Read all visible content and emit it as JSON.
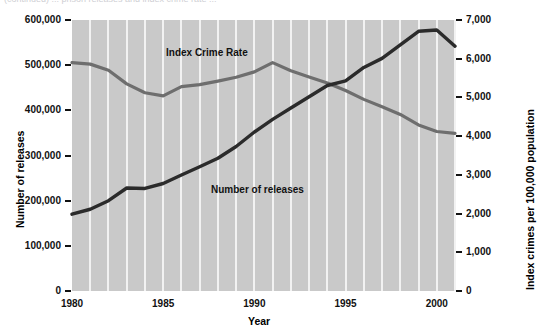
{
  "caption_clipped": "(continued)  ...  prison releases and index crime rate ...",
  "chart_data": {
    "type": "line",
    "title": "",
    "xlabel": "Year",
    "ylabel": "Number of releases",
    "y2label": "Index crimes per 100,000 population",
    "xlim": [
      1980,
      2001
    ],
    "ylim": [
      0,
      600000
    ],
    "y2lim": [
      0,
      7000
    ],
    "grid": "vertical-white-gridlines",
    "legend": "inline-labels",
    "xticks": [
      "1980",
      "1985",
      "1990",
      "1995",
      "2000"
    ],
    "xtick_values": [
      1980,
      1985,
      1990,
      1995,
      2000
    ],
    "yticks": [
      "0",
      "100,000",
      "200,000",
      "300,000",
      "400,000",
      "500,000",
      "600,000"
    ],
    "ytick_values": [
      0,
      100000,
      200000,
      300000,
      400000,
      500000,
      600000
    ],
    "y2ticks": [
      "0",
      "1,000",
      "2,000",
      "3,000",
      "4,000",
      "5,000",
      "6,000",
      "7,000"
    ],
    "y2tick_values": [
      0,
      1000,
      2000,
      3000,
      4000,
      5000,
      6000,
      7000
    ],
    "x": [
      1980,
      1981,
      1982,
      1983,
      1984,
      1985,
      1986,
      1987,
      1988,
      1989,
      1990,
      1991,
      1992,
      1993,
      1994,
      1995,
      1996,
      1997,
      1998,
      1999,
      2000,
      2001
    ],
    "series": [
      {
        "name": "Number of releases",
        "axis": "left",
        "color": "#2b2b2b",
        "annotation": "Number of releases",
        "values": [
          170000,
          181000,
          200000,
          228000,
          227000,
          238000,
          257000,
          275000,
          294000,
          320000,
          352000,
          380000,
          405000,
          430000,
          455000,
          465000,
          495000,
          515000,
          545000,
          575000,
          578000,
          542000
        ]
      },
      {
        "name": "Index Crime Rate",
        "axis": "right",
        "color": "#6e6e6e",
        "annotation": "Index Crime Rate",
        "values": [
          5900,
          5860,
          5700,
          5350,
          5120,
          5040,
          5280,
          5330,
          5420,
          5520,
          5660,
          5900,
          5690,
          5530,
          5370,
          5180,
          4950,
          4760,
          4560,
          4290,
          4120,
          4070
        ]
      }
    ]
  }
}
